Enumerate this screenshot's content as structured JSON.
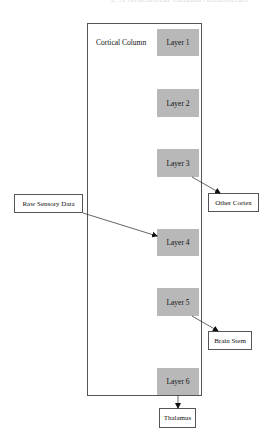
{
  "header": {
    "faint_text": "3. A Neocortical Column Architecture"
  },
  "column": {
    "label": "Cortical Column"
  },
  "layers": [
    {
      "label": "Layer 1"
    },
    {
      "label": "Layer 2"
    },
    {
      "label": "Layer 3"
    },
    {
      "label": "Layer 4"
    },
    {
      "label": "Layer 5"
    },
    {
      "label": "Layer 6"
    }
  ],
  "external_nodes": {
    "raw_sensory": "Raw Sensory Data",
    "other_cortex": "Other Cortex",
    "brain_stem": "Brain Stem",
    "thalamus": "Thalamus"
  },
  "edges": [
    {
      "from": "Raw Sensory Data",
      "to": "Layer 4"
    },
    {
      "from": "Layer 3",
      "to": "Other Cortex"
    },
    {
      "from": "Layer 5",
      "to": "Brain Stem"
    },
    {
      "from": "Layer 6",
      "to": "Thalamus"
    }
  ],
  "colors": {
    "layer_fill": "#b8b8b8",
    "border": "#555555"
  }
}
